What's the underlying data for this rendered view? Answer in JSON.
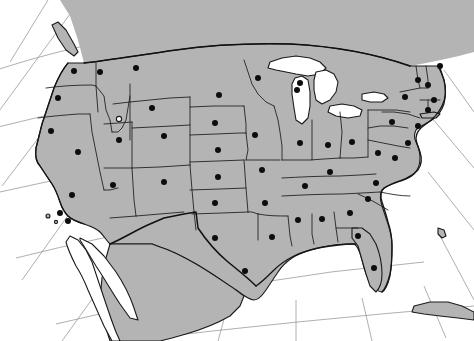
{
  "map": {
    "title": "Contiguous United States",
    "projection": "conic",
    "background_color": "#ffffff",
    "land_color": "#b4b4b4",
    "water_color": "#ffffff",
    "boundary_color": "#1a1a1a",
    "graticule_color": "#9a9a9a",
    "marker_color": "#0d0d0d",
    "marker_radius_px": 3,
    "width_px": 474,
    "height_px": 341,
    "legend_text": "",
    "labels_shown": "none"
  },
  "graticule": {
    "meridians_visible_over_water": true,
    "parallels_visible_over_water": true,
    "line_count_meridians": 9,
    "line_count_parallels": 5
  },
  "water_features": [
    {
      "name": "Lake Superior"
    },
    {
      "name": "Lake Michigan"
    },
    {
      "name": "Lake Huron"
    },
    {
      "name": "Lake Erie"
    },
    {
      "name": "Lake Ontario"
    },
    {
      "name": "Great Salt Lake"
    },
    {
      "name": "Lake Okeechobee"
    },
    {
      "name": "Gulf of California"
    },
    {
      "name": "Gulf of Mexico"
    },
    {
      "name": "Atlantic Ocean"
    },
    {
      "name": "Pacific Ocean"
    },
    {
      "name": "Chesapeake Bay"
    },
    {
      "name": "Puget Sound"
    },
    {
      "name": "San Francisco Bay"
    }
  ],
  "land_features": [
    {
      "name": "United States",
      "filled": true
    },
    {
      "name": "Canada",
      "filled": true
    },
    {
      "name": "Mexico",
      "filled": true
    },
    {
      "name": "Baja California",
      "filled": false
    },
    {
      "name": "Cuba",
      "filled": true
    },
    {
      "name": "Bahamas",
      "filled": true
    },
    {
      "name": "Vancouver Island",
      "filled": true
    },
    {
      "name": "Long Island",
      "filled": true
    },
    {
      "name": "Channel Islands",
      "filled": true
    }
  ],
  "markers": [
    {
      "label": "WA",
      "x": 74,
      "y": 71
    },
    {
      "label": "OR",
      "x": 58,
      "y": 98
    },
    {
      "label": "CA-N",
      "x": 51,
      "y": 131
    },
    {
      "label": "ID",
      "x": 100,
      "y": 72
    },
    {
      "label": "NV",
      "x": 78,
      "y": 152
    },
    {
      "label": "MT",
      "x": 136,
      "y": 68
    },
    {
      "label": "WY",
      "x": 152,
      "y": 108
    },
    {
      "label": "UT",
      "x": 119,
      "y": 140
    },
    {
      "label": "CO",
      "x": 164,
      "y": 136
    },
    {
      "label": "AZ",
      "x": 113,
      "y": 185
    },
    {
      "label": "NM",
      "x": 164,
      "y": 182
    },
    {
      "label": "CA-S",
      "x": 72,
      "y": 195
    },
    {
      "label": "CA-LA",
      "x": 60,
      "y": 213
    },
    {
      "label": "CA-SD",
      "x": 68,
      "y": 221
    },
    {
      "label": "ND",
      "x": 219,
      "y": 95
    },
    {
      "label": "SD",
      "x": 215,
      "y": 123
    },
    {
      "label": "NE",
      "x": 218,
      "y": 150
    },
    {
      "label": "KS",
      "x": 218,
      "y": 177
    },
    {
      "label": "OK",
      "x": 215,
      "y": 203
    },
    {
      "label": "TX",
      "x": 215,
      "y": 238
    },
    {
      "label": "TX-S",
      "x": 245,
      "y": 271
    },
    {
      "label": "MN",
      "x": 258,
      "y": 78
    },
    {
      "label": "IA",
      "x": 255,
      "y": 135
    },
    {
      "label": "MO",
      "x": 262,
      "y": 170
    },
    {
      "label": "AR",
      "x": 265,
      "y": 203
    },
    {
      "label": "LA",
      "x": 272,
      "y": 237
    },
    {
      "label": "WI",
      "x": 297,
      "y": 90
    },
    {
      "label": "IL",
      "x": 300,
      "y": 143
    },
    {
      "label": "MS",
      "x": 298,
      "y": 220
    },
    {
      "label": "TN",
      "x": 305,
      "y": 186
    },
    {
      "label": "MI",
      "x": 300,
      "y": 83
    },
    {
      "label": "IN",
      "x": 328,
      "y": 145
    },
    {
      "label": "KY",
      "x": 330,
      "y": 172
    },
    {
      "label": "AL",
      "x": 322,
      "y": 219
    },
    {
      "label": "OH",
      "x": 352,
      "y": 142
    },
    {
      "label": "GA",
      "x": 350,
      "y": 213
    },
    {
      "label": "FL-N",
      "x": 358,
      "y": 236
    },
    {
      "label": "FL-S",
      "x": 374,
      "y": 268
    },
    {
      "label": "SC",
      "x": 368,
      "y": 199
    },
    {
      "label": "NC",
      "x": 376,
      "y": 183
    },
    {
      "label": "WV",
      "x": 378,
      "y": 153
    },
    {
      "label": "VA",
      "x": 395,
      "y": 158
    },
    {
      "label": "PA",
      "x": 392,
      "y": 122
    },
    {
      "label": "NY",
      "x": 405,
      "y": 97
    },
    {
      "label": "MD",
      "x": 408,
      "y": 143
    },
    {
      "label": "NJ",
      "x": 418,
      "y": 126
    },
    {
      "label": "CT",
      "x": 428,
      "y": 110
    },
    {
      "label": "MA",
      "x": 434,
      "y": 100
    },
    {
      "label": "NH",
      "x": 428,
      "y": 85
    },
    {
      "label": "VT",
      "x": 418,
      "y": 80
    },
    {
      "label": "ME",
      "x": 440,
      "y": 66
    }
  ],
  "marker_count": 51
}
